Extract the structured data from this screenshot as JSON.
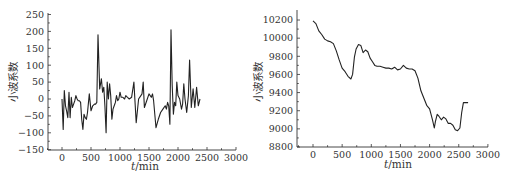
{
  "chart_data": [
    {
      "type": "line",
      "title": "",
      "xlabel": "t/min",
      "ylabel": "小波系数",
      "xlim": [
        -250,
        3000
      ],
      "ylim": [
        -150,
        250
      ],
      "xticks": [
        0,
        500,
        1000,
        1500,
        2000,
        2500,
        3000
      ],
      "yticks": [
        -150,
        -100,
        -50,
        0,
        50,
        100,
        150,
        200,
        250
      ],
      "grid": false,
      "legend": null,
      "x": [
        0,
        20,
        40,
        60,
        80,
        100,
        120,
        140,
        160,
        180,
        200,
        220,
        240,
        260,
        280,
        300,
        320,
        340,
        360,
        380,
        400,
        420,
        440,
        470,
        500,
        530,
        560,
        580,
        600,
        620,
        650,
        680,
        700,
        720,
        740,
        760,
        780,
        800,
        820,
        840,
        860,
        880,
        900,
        920,
        940,
        960,
        980,
        1000,
        1020,
        1050,
        1080,
        1100,
        1130,
        1160,
        1200,
        1240,
        1280,
        1320,
        1360,
        1380,
        1400,
        1420,
        1460,
        1500,
        1540,
        1560,
        1580,
        1620,
        1660,
        1700,
        1740,
        1780,
        1800,
        1820,
        1840,
        1860,
        1880,
        1900,
        1920,
        1940,
        1960,
        1980,
        2000,
        2030,
        2060,
        2080,
        2100,
        2120,
        2150,
        2180,
        2200,
        2230,
        2260,
        2290,
        2320,
        2350,
        2380,
        2400,
        2420,
        2450,
        2480,
        2500,
        2530,
        2550,
        2570,
        2590,
        2610,
        2630,
        2650,
        2660
      ],
      "values": [
        0,
        -90,
        25,
        -20,
        -35,
        -55,
        20,
        -55,
        5,
        -25,
        -15,
        -5,
        10,
        0,
        -5,
        -5,
        -10,
        -60,
        -90,
        -45,
        -55,
        -60,
        -40,
        15,
        -35,
        -20,
        -15,
        -15,
        -10,
        190,
        30,
        60,
        20,
        35,
        -20,
        -100,
        50,
        0,
        45,
        10,
        -60,
        -30,
        -20,
        -10,
        10,
        -5,
        0,
        20,
        5,
        5,
        0,
        10,
        5,
        0,
        5,
        50,
        -70,
        0,
        10,
        15,
        50,
        -25,
        -5,
        15,
        5,
        15,
        -5,
        -85,
        -60,
        -40,
        -30,
        -20,
        -30,
        -10,
        -20,
        -75,
        205,
        40,
        -45,
        -10,
        -20,
        50,
        10,
        0,
        -30,
        -15,
        45,
        0,
        -40,
        10,
        115,
        -25,
        30,
        -25,
        35,
        -20,
        0
      ],
      "series": [
        {
          "name": "wavelet coefficient (detail)"
        }
      ]
    },
    {
      "type": "line",
      "title": "",
      "xlabel": "t/min",
      "ylabel": "小波系数",
      "xlim": [
        -250,
        3000
      ],
      "ylim": [
        8800,
        10300
      ],
      "xticks": [
        0,
        500,
        1000,
        1500,
        2000,
        2500,
        3000
      ],
      "yticks": [
        8800,
        9000,
        9200,
        9400,
        9600,
        9800,
        10000,
        10200
      ],
      "grid": false,
      "legend": null,
      "x": [
        0,
        50,
        100,
        150,
        200,
        250,
        300,
        350,
        400,
        450,
        500,
        550,
        600,
        650,
        680,
        710,
        740,
        780,
        820,
        860,
        900,
        940,
        980,
        1020,
        1060,
        1100,
        1150,
        1200,
        1250,
        1300,
        1350,
        1400,
        1450,
        1500,
        1550,
        1600,
        1650,
        1700,
        1750,
        1800,
        1850,
        1900,
        1950,
        2000,
        2050,
        2080,
        2100,
        2130,
        2160,
        2200,
        2240,
        2280,
        2320,
        2360,
        2400,
        2440,
        2480,
        2520,
        2550,
        2580,
        2620,
        2660
      ],
      "values": [
        10190,
        10160,
        10080,
        10040,
        9990,
        9970,
        9960,
        9940,
        9860,
        9760,
        9670,
        9630,
        9580,
        9550,
        9600,
        9790,
        9880,
        9930,
        9920,
        9840,
        9870,
        9850,
        9780,
        9740,
        9700,
        9690,
        9690,
        9680,
        9670,
        9670,
        9660,
        9680,
        9650,
        9660,
        9700,
        9670,
        9660,
        9660,
        9640,
        9560,
        9420,
        9340,
        9260,
        9220,
        9100,
        9010,
        9080,
        9160,
        9140,
        9100,
        9130,
        9110,
        9060,
        9060,
        9040,
        8990,
        8980,
        9010,
        9180,
        9290,
        9290,
        9290
      ],
      "series": [
        {
          "name": "wavelet coefficient (approximation)"
        }
      ]
    }
  ]
}
